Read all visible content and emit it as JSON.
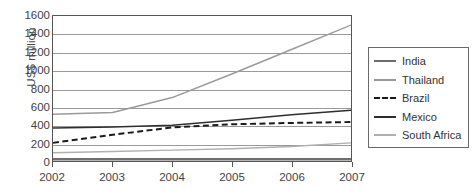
{
  "chart_data": {
    "type": "line",
    "title": "",
    "xlabel": "",
    "ylabel": "US$ million",
    "categories": [
      "2002",
      "2003",
      "2004",
      "2005",
      "2006",
      "2007"
    ],
    "x": [
      2002,
      2003,
      2004,
      2005,
      2006,
      2007
    ],
    "ylim": [
      0,
      1600
    ],
    "ytick_step": 200,
    "yticks": [
      "0",
      "200",
      "400",
      "600",
      "800",
      "1000",
      "1200",
      "1400",
      "1600"
    ],
    "grid": "horizontal",
    "legend_position": "right",
    "series": [
      {
        "name": "India",
        "values": [
          20,
          20,
          20,
          20,
          20,
          20
        ],
        "color": "#6e6e6e",
        "style": "solid",
        "width": 2.6
      },
      {
        "name": "Thailand",
        "values": [
          515,
          535,
          700,
          960,
          1230,
          1500
        ],
        "color": "#9a9a9a",
        "style": "solid",
        "width": 1.5
      },
      {
        "name": "Brazil",
        "values": [
          200,
          290,
          370,
          405,
          420,
          430
        ],
        "color": "#1a1a1a",
        "style": "dashed",
        "width": 2.0
      },
      {
        "name": "Mexico",
        "values": [
          365,
          375,
          395,
          450,
          510,
          560
        ],
        "color": "#2e2e2e",
        "style": "solid",
        "width": 1.6
      },
      {
        "name": "South Africa",
        "values": [
          90,
          105,
          120,
          135,
          160,
          200
        ],
        "color": "#b0b0b0",
        "style": "solid",
        "width": 1.5
      }
    ]
  },
  "legend": {
    "items": [
      {
        "label": "India"
      },
      {
        "label": "Thailand"
      },
      {
        "label": "Brazil"
      },
      {
        "label": "Mexico"
      },
      {
        "label": "South Africa"
      }
    ]
  }
}
